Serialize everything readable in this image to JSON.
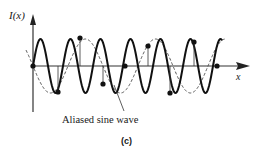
{
  "figure": {
    "y_axis_label": "I(x)",
    "x_axis_label": "x",
    "callout_label": "Aliased sine wave",
    "caption": "(c)"
  },
  "diagram": {
    "series": [
      {
        "name": "Original sine wave",
        "style": "solid",
        "color": "#111111",
        "amplitude_px": 27,
        "period_px": 30
      },
      {
        "name": "Aliased sine wave",
        "style": "dashed",
        "color": "#555555",
        "amplitude_px": 27,
        "period_px": 70
      }
    ],
    "sample_points_px": [
      [
        33,
        66
      ],
      [
        80,
        38
      ],
      [
        58,
        92
      ],
      [
        103,
        84
      ],
      [
        125,
        66
      ],
      [
        148,
        46
      ],
      [
        170,
        93
      ],
      [
        194,
        42
      ],
      [
        217,
        66
      ]
    ],
    "axis_origin_px": [
      33,
      66
    ],
    "x_axis_end_px": 245
  }
}
